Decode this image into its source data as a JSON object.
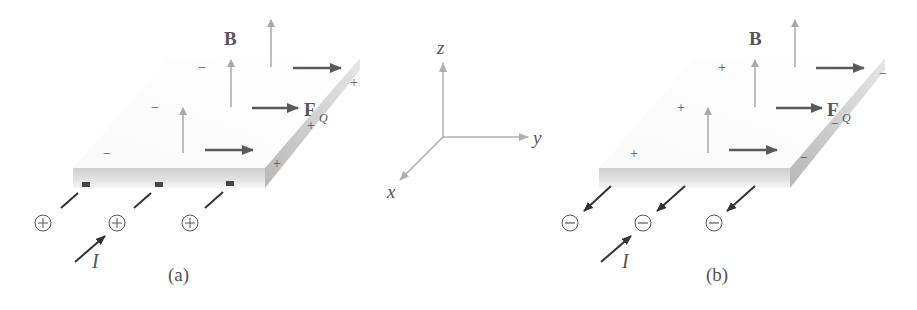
{
  "figure": {
    "panel_a": {
      "caption": "(a)",
      "field_label": "B",
      "force_label": "F",
      "force_subscript": "Q",
      "current_label": "I",
      "carrier_symbol": "+",
      "top_edge_charge": "−",
      "side_edge_charge": "+"
    },
    "panel_b": {
      "caption": "(b)",
      "field_label": "B",
      "force_label": "F",
      "force_subscript": "Q",
      "current_label": "I",
      "carrier_symbol": "−",
      "top_edge_charge": "+",
      "side_edge_charge": "−"
    },
    "axes": {
      "x_label": "x",
      "y_label": "y",
      "z_label": "z"
    }
  },
  "colors": {
    "field_arrow": "#a8a8a8",
    "force_arrow": "#5a5a5a",
    "current_arrow": "#333333",
    "slab_face": "#c8c8c8",
    "slab_side": "#bdbdbd",
    "axis": "#b0b0b0",
    "text": "#555555"
  }
}
